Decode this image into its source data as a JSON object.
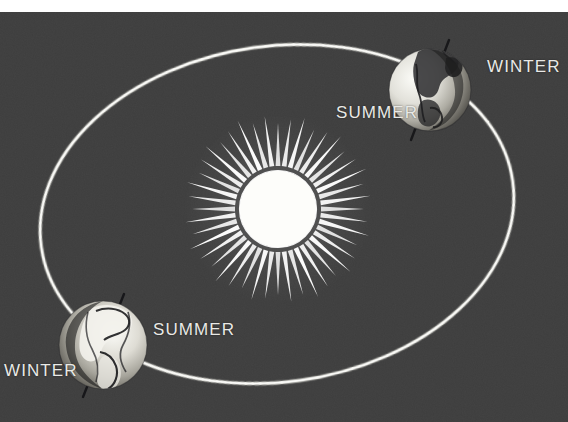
{
  "figure": {
    "type": "astronomy-diagram",
    "background_color": "#3e3e3e",
    "ink_color": "#e9e9e6",
    "width": 568,
    "height": 422
  },
  "sun": {
    "name": "sun",
    "center_x": 278,
    "center_y": 209,
    "disc_radius": 38,
    "ray_count": 44,
    "ray_inner_radius": 43,
    "ray_outer_radius": 92,
    "color": "#ffffff"
  },
  "orbit": {
    "name": "orbit-ellipse",
    "center_x": 277,
    "center_y": 214,
    "radius_x": 238,
    "radius_y": 168,
    "rotation_deg": -8,
    "stroke_color": "#e6e6e2",
    "stroke_width": 3
  },
  "earths": [
    {
      "id": "earth-top-right",
      "label_position": "upper-right of orbit",
      "center_x": 430,
      "center_y": 90,
      "radius": 41,
      "axis_tilt_deg": 23.5,
      "lit_side": "left",
      "labels": [
        {
          "text": "WINTER",
          "x": 487,
          "y": 45,
          "id": "winter-northern"
        },
        {
          "text": "SUMMER",
          "x": 336,
          "y": 91,
          "id": "summer-southern"
        }
      ]
    },
    {
      "id": "earth-bottom-left",
      "label_position": "lower-left of orbit",
      "center_x": 103,
      "center_y": 345,
      "radius": 44,
      "axis_tilt_deg": 23.5,
      "lit_side": "right",
      "labels": [
        {
          "text": "SUMMER",
          "x": 153,
          "y": 308,
          "id": "summer-northern"
        },
        {
          "text": "WINTER",
          "x": 4,
          "y": 349,
          "id": "winter-southern"
        }
      ]
    }
  ],
  "labels": {
    "winter_top": "WINTER",
    "summer_top": "SUMMER",
    "summer_bottom": "SUMMER",
    "winter_bottom": "WINTER"
  }
}
